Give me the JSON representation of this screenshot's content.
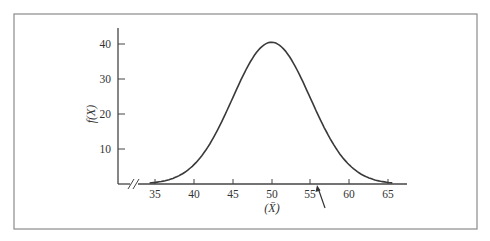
{
  "chart_data": {
    "type": "line",
    "title": "",
    "xlabel": "(X̄)",
    "ylabel": "f(X)",
    "xlim": [
      33,
      67
    ],
    "ylim": [
      0,
      45
    ],
    "x_ticks": [
      35,
      40,
      45,
      50,
      55,
      60,
      65
    ],
    "y_ticks": [
      10,
      20,
      30,
      40
    ],
    "x_axis_break": true,
    "grid": false,
    "legend": null,
    "series": [
      {
        "name": "normal density",
        "distribution": "normal",
        "mean": 50,
        "sd": 5,
        "peak": 40.5,
        "x": [
          35,
          37.5,
          40,
          42.5,
          45,
          47.5,
          50,
          52.5,
          55,
          57.5,
          60,
          62.5,
          65
        ],
        "y": [
          0.5,
          1.8,
          5.5,
          13.2,
          24.6,
          35.7,
          40.5,
          35.7,
          24.6,
          13.2,
          5.5,
          1.8,
          0.5
        ]
      }
    ],
    "annotations": [
      {
        "type": "arrow",
        "points_to_x": 56,
        "description": "arrow pointing to x-axis just right of 55"
      }
    ]
  },
  "labels": {
    "x_axis": "(X̄)",
    "y_axis": "f(X)",
    "x_ticks": [
      "35",
      "40",
      "45",
      "50",
      "55",
      "60",
      "65"
    ],
    "y_ticks": [
      "10",
      "20",
      "30",
      "40"
    ]
  }
}
